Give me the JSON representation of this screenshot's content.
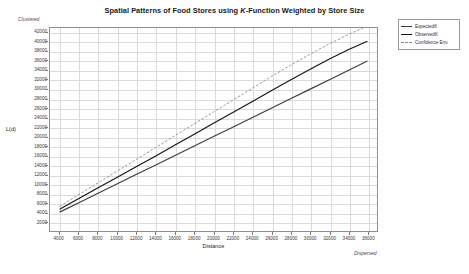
{
  "chart_data": {
    "type": "line",
    "title": "Spatial Patterns of Food Stores using K-Function Weighted by Store Size",
    "title_parts": {
      "before": "Spatial Patterns of Food Stores using ",
      "italic": "K",
      "after": "-Function Weighted by Store Size"
    },
    "xlabel": "Distance",
    "ylabel": "L(d)",
    "xlim": [
      3000,
      37000
    ],
    "ylim": [
      0,
      43000
    ],
    "grid": true,
    "legend_position": "outside-right-top",
    "annotations": [
      {
        "text": "Clustered",
        "position": "top-left-of-y-axis"
      },
      {
        "text": "Dispersed",
        "position": "bottom-right-of-x-axis"
      }
    ],
    "xticks": [
      4000,
      6000,
      8000,
      10000,
      12000,
      14000,
      16000,
      18000,
      20000,
      22000,
      24000,
      26000,
      28000,
      30000,
      32000,
      34000,
      36000
    ],
    "yticks": [
      2000,
      4000,
      6000,
      8000,
      10000,
      12000,
      14000,
      16000,
      18000,
      20000,
      22000,
      24000,
      26000,
      28000,
      30000,
      32000,
      34000,
      36000,
      38000,
      40000,
      42000
    ],
    "x": [
      4000,
      6000,
      8000,
      10000,
      12000,
      14000,
      16000,
      18000,
      20000,
      22000,
      24000,
      26000,
      28000,
      30000,
      32000,
      34000,
      36000
    ],
    "series": [
      {
        "name": "ExpectedK",
        "style": "solid",
        "color": "#3c3c3c",
        "values": [
          4000,
          6000,
          8000,
          10000,
          12000,
          14000,
          16000,
          18000,
          20000,
          22000,
          24000,
          26000,
          28000,
          30000,
          32000,
          34000,
          36000
        ]
      },
      {
        "name": "ObservedK",
        "style": "solid",
        "color": "#141414",
        "values": [
          4600,
          6900,
          9150,
          11400,
          13650,
          15900,
          18200,
          20500,
          22800,
          25100,
          27400,
          29700,
          32000,
          34200,
          36400,
          38400,
          40200
        ]
      },
      {
        "name": "Confidence Env.",
        "style": "dashed",
        "color": "#8a8a8a",
        "values": [
          5200,
          7700,
          10200,
          12700,
          15200,
          17700,
          20200,
          22700,
          25200,
          27700,
          30200,
          32700,
          35100,
          37400,
          39600,
          41600,
          43400
        ]
      }
    ]
  },
  "legend": {
    "items": [
      {
        "label": "ExpectedK"
      },
      {
        "label": "ObservedK"
      },
      {
        "label": "Confidence Env."
      }
    ]
  }
}
